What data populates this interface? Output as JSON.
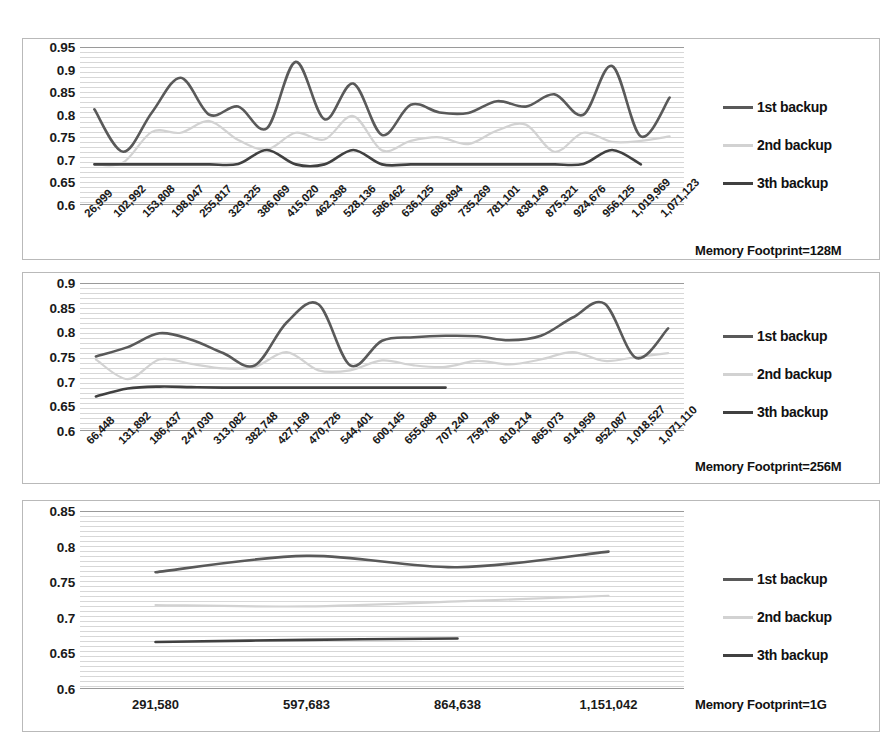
{
  "figure": {
    "title": "",
    "panel_count": 3
  },
  "legend": {
    "series": [
      {
        "label": "1st backup",
        "color": "#595959"
      },
      {
        "label": "2nd backup",
        "color": "#d2d2d2"
      },
      {
        "label": "3th backup",
        "color": "#404040"
      }
    ]
  },
  "panels": [
    {
      "footprint_label": "Memory Footprint=128M",
      "y_ticks": [
        "0.95",
        "0.9",
        "0.85",
        "0.8",
        "0.75",
        "0.7",
        "0.65",
        "0.6"
      ],
      "x_labels": [
        "26,999",
        "102,992",
        "153,808",
        "198,047",
        "255,817",
        "329,325",
        "386,069",
        "415,020",
        "462,398",
        "528,136",
        "586,462",
        "636,125",
        "686,894",
        "735,269",
        "781,101",
        "838,149",
        "875,321",
        "924,676",
        "956,125",
        "1,019,969",
        "1,071,123"
      ]
    },
    {
      "footprint_label": "Memory Footprint=256M",
      "y_ticks": [
        "0.9",
        "0.85",
        "0.8",
        "0.75",
        "0.7",
        "0.65",
        "0.6"
      ],
      "x_labels": [
        "66,448",
        "131,892",
        "186,437",
        "247,030",
        "313,082",
        "382,748",
        "427,169",
        "470,726",
        "544,401",
        "600,145",
        "655,688",
        "707,240",
        "759,796",
        "810,214",
        "865,073",
        "914,959",
        "952,087",
        "1,018,527",
        "1,071,110"
      ]
    },
    {
      "footprint_label": "Memory Footprint=1G",
      "y_ticks": [
        "0.85",
        "0.8",
        "0.75",
        "0.7",
        "0.65",
        "0.6"
      ],
      "x_labels": [
        "291,580",
        "597,683",
        "864,638",
        "1,151,042"
      ]
    }
  ],
  "chart_data": [
    {
      "type": "line",
      "title": "Memory Footprint=128M",
      "xlabel": "",
      "ylabel": "",
      "ylim": [
        0.6,
        0.95
      ],
      "grid": true,
      "legend_position": "right",
      "categories": [
        "26,999",
        "102,992",
        "153,808",
        "198,047",
        "255,817",
        "329,325",
        "386,069",
        "415,020",
        "462,398",
        "528,136",
        "586,462",
        "636,125",
        "686,894",
        "735,269",
        "781,101",
        "838,149",
        "875,321",
        "924,676",
        "956,125",
        "1,019,969",
        "1,071,123"
      ],
      "series": [
        {
          "name": "1st backup",
          "color": "#595959",
          "values": [
            0.812,
            0.718,
            0.805,
            0.882,
            0.8,
            0.818,
            0.77,
            0.917,
            0.79,
            0.869,
            0.755,
            0.822,
            0.805,
            0.804,
            0.83,
            0.818,
            0.845,
            0.8,
            0.908,
            0.752,
            0.838
          ]
        },
        {
          "name": "2nd backup",
          "color": "#d2d2d2",
          "values": [
            0.69,
            0.694,
            0.762,
            0.76,
            0.786,
            0.744,
            0.723,
            0.76,
            0.745,
            0.797,
            0.721,
            0.742,
            0.75,
            0.735,
            0.765,
            0.778,
            0.718,
            0.76,
            0.74,
            0.742,
            0.752
          ]
        },
        {
          "name": "3th backup",
          "color": "#404040",
          "values": [
            0.69,
            0.69,
            0.69,
            0.69,
            0.69,
            0.691,
            0.722,
            0.69,
            0.69,
            0.722,
            0.69,
            0.69,
            0.69,
            0.69,
            0.69,
            0.69,
            0.69,
            0.691,
            0.722,
            0.69,
            null
          ]
        }
      ]
    },
    {
      "type": "line",
      "title": "Memory Footprint=256M",
      "xlabel": "",
      "ylabel": "",
      "ylim": [
        0.6,
        0.9
      ],
      "grid": true,
      "legend_position": "right",
      "categories": [
        "66,448",
        "131,892",
        "186,437",
        "247,030",
        "313,082",
        "382,748",
        "427,169",
        "470,726",
        "544,401",
        "600,145",
        "655,688",
        "707,240",
        "759,796",
        "810,214",
        "865,073",
        "914,959",
        "952,087",
        "1,018,527",
        "1,071,110"
      ],
      "series": [
        {
          "name": "1st backup",
          "color": "#595959",
          "values": [
            0.751,
            0.77,
            0.798,
            0.785,
            0.758,
            0.733,
            0.82,
            0.857,
            0.733,
            0.783,
            0.79,
            0.793,
            0.792,
            0.784,
            0.793,
            0.83,
            0.858,
            0.748,
            0.808
          ]
        },
        {
          "name": "2nd backup",
          "color": "#d2d2d2",
          "values": [
            0.745,
            0.705,
            0.745,
            0.736,
            0.727,
            0.73,
            0.76,
            0.723,
            0.723,
            0.743,
            0.733,
            0.73,
            0.742,
            0.735,
            0.745,
            0.76,
            0.742,
            0.75,
            0.758
          ]
        },
        {
          "name": "3th backup",
          "color": "#404040",
          "values": [
            0.67,
            0.686,
            0.69,
            0.689,
            0.688,
            0.688,
            0.688,
            0.688,
            0.688,
            0.688,
            0.688,
            0.688,
            null,
            null,
            null,
            null,
            null,
            null,
            null
          ]
        }
      ]
    },
    {
      "type": "line",
      "title": "Memory Footprint=1G",
      "xlabel": "",
      "ylabel": "",
      "ylim": [
        0.6,
        0.85
      ],
      "grid": true,
      "legend_position": "right",
      "categories": [
        "291,580",
        "597,683",
        "864,638",
        "1,151,042"
      ],
      "series": [
        {
          "name": "1st backup",
          "color": "#595959",
          "values": [
            0.764,
            0.787,
            0.771,
            0.793
          ]
        },
        {
          "name": "2nd backup",
          "color": "#d2d2d2",
          "values": [
            0.718,
            0.716,
            0.723,
            0.731
          ]
        },
        {
          "name": "3th backup",
          "color": "#404040",
          "values": [
            0.666,
            0.669,
            0.671,
            null
          ]
        }
      ]
    }
  ]
}
